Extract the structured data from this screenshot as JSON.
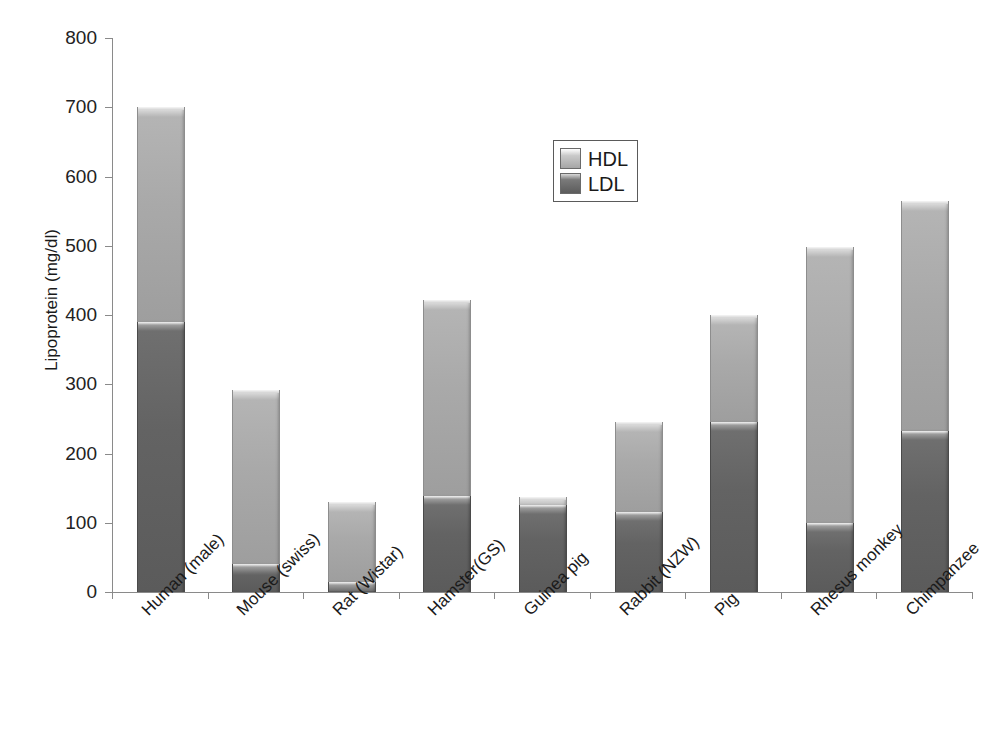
{
  "chart_data": {
    "type": "bar",
    "subtype": "stacked-bar",
    "title": "",
    "xlabel": "",
    "ylabel": "Lipoprotein (mg/dl)",
    "ylim": [
      0,
      800
    ],
    "ytick_step": 100,
    "yticks": [
      "800",
      "700",
      "600",
      "500",
      "400",
      "300",
      "200",
      "100",
      "0"
    ],
    "grid": false,
    "legend_position": "upper-center",
    "categories": [
      "Human (male)",
      "Mouse (swiss)",
      "Rat (Wistar)",
      "Hamster(GS)",
      "Guinea pig",
      "Rabbit (NZW)",
      "Pig",
      "Rhesus monkey",
      "Chimpanzee"
    ],
    "series": [
      {
        "name": "LDL",
        "color": "#5e5e5e",
        "values": [
          390,
          40,
          15,
          138,
          125,
          115,
          245,
          100,
          232
        ]
      },
      {
        "name": "HDL",
        "color": "#aaaaaa",
        "values": [
          310,
          252,
          115,
          284,
          12,
          130,
          155,
          398,
          333
        ]
      }
    ],
    "totals": [
      700,
      292,
      130,
      422,
      137,
      245,
      400,
      498,
      565
    ]
  },
  "legend": {
    "items": [
      {
        "label": "HDL",
        "swatch": "hdl"
      },
      {
        "label": "LDL",
        "swatch": "ldl"
      }
    ]
  }
}
